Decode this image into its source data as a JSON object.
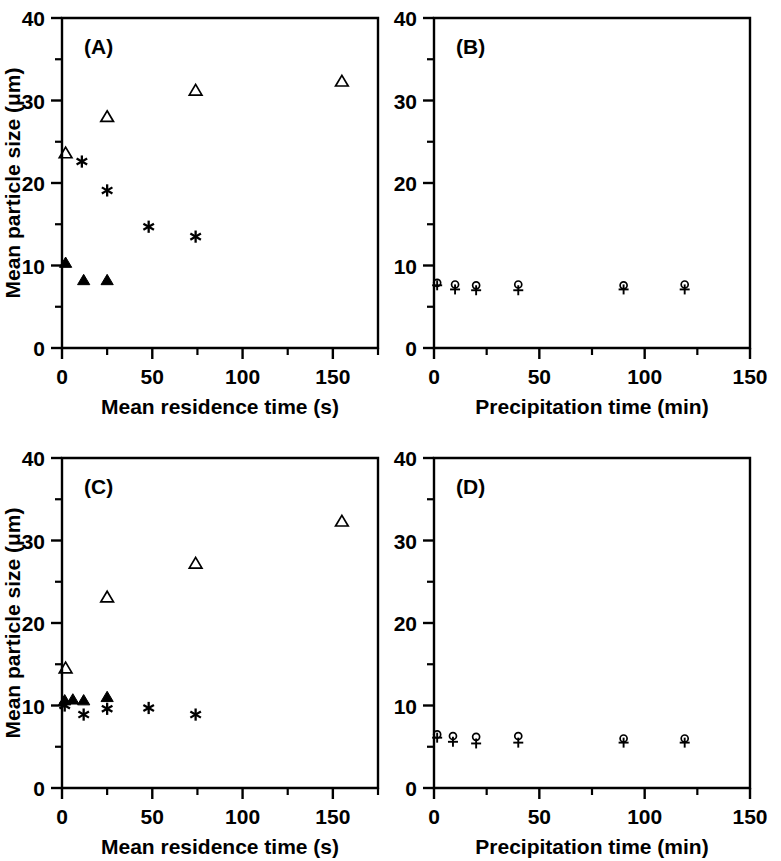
{
  "figure": {
    "panels_order": [
      "A",
      "B",
      "C",
      "D"
    ]
  },
  "panelA": {
    "label": "(A)",
    "xlabel": "Mean residence time (s)",
    "ylabel": "Mean particle size (μm)",
    "xticks": [
      "0",
      "50",
      "100",
      "150"
    ],
    "yticks": [
      "0",
      "10",
      "20",
      "30",
      "40"
    ]
  },
  "panelB": {
    "label": "(B)",
    "xlabel": "Precipitation time (min)",
    "ylabel": "",
    "xticks": [
      "0",
      "50",
      "100",
      "150"
    ],
    "yticks": [
      "0",
      "10",
      "20",
      "30",
      "40"
    ]
  },
  "panelC": {
    "label": "(C)",
    "xlabel": "Mean residence time (s)",
    "ylabel": "Mean particle size (μm)",
    "xticks": [
      "0",
      "50",
      "100",
      "150"
    ],
    "yticks": [
      "0",
      "10",
      "20",
      "30",
      "40"
    ]
  },
  "panelD": {
    "label": "(D)",
    "xlabel": "Precipitation time (min)",
    "ylabel": "",
    "xticks": [
      "0",
      "50",
      "100",
      "150"
    ],
    "yticks": [
      "0",
      "10",
      "20",
      "30",
      "40"
    ]
  },
  "chart_data": [
    {
      "id": "A",
      "type": "scatter",
      "title": "(A)",
      "xlabel": "Mean residence time (s)",
      "ylabel": "Mean particle size (μm)",
      "xlim": [
        0,
        175
      ],
      "ylim": [
        0,
        40
      ],
      "xticks": [
        0,
        50,
        100,
        150
      ],
      "yticks": [
        0,
        10,
        20,
        30,
        40
      ],
      "xminor": [
        25,
        75,
        125,
        175
      ],
      "yminor": [
        5,
        15,
        25,
        35
      ],
      "grid": false,
      "legend": "none",
      "series": [
        {
          "name": "open-triangle",
          "marker": "open-triangle",
          "points": [
            {
              "x": 2,
              "y": 23.6
            },
            {
              "x": 25,
              "y": 28.0
            },
            {
              "x": 74,
              "y": 31.2
            },
            {
              "x": 155,
              "y": 32.3
            }
          ]
        },
        {
          "name": "asterisk",
          "marker": "asterisk",
          "points": [
            {
              "x": 11,
              "y": 22.6
            },
            {
              "x": 25,
              "y": 19.1
            },
            {
              "x": 48,
              "y": 14.7
            },
            {
              "x": 74,
              "y": 13.5
            }
          ]
        },
        {
          "name": "filled-triangle",
          "marker": "filled-triangle",
          "points": [
            {
              "x": 2,
              "y": 10.3
            },
            {
              "x": 12,
              "y": 8.2
            },
            {
              "x": 25,
              "y": 8.2
            }
          ]
        }
      ]
    },
    {
      "id": "B",
      "type": "scatter",
      "title": "(B)",
      "xlabel": "Precipitation time (min)",
      "ylabel": "Mean particle size (μm)",
      "xlim": [
        0,
        150
      ],
      "ylim": [
        0,
        40
      ],
      "xticks": [
        0,
        50,
        100,
        150
      ],
      "yticks": [
        0,
        10,
        20,
        30,
        40
      ],
      "xminor": [
        25,
        75,
        125
      ],
      "yminor": [
        5,
        15,
        25,
        35
      ],
      "grid": false,
      "legend": "none",
      "series": [
        {
          "name": "open-circle",
          "marker": "open-circle",
          "points": [
            {
              "x": 1.5,
              "y": 7.9
            },
            {
              "x": 10,
              "y": 7.7
            },
            {
              "x": 20,
              "y": 7.6
            },
            {
              "x": 40,
              "y": 7.7
            },
            {
              "x": 90,
              "y": 7.6
            },
            {
              "x": 119,
              "y": 7.7
            }
          ]
        },
        {
          "name": "plus",
          "marker": "plus",
          "points": [
            {
              "x": 1.5,
              "y": 7.6
            },
            {
              "x": 10,
              "y": 7.1
            },
            {
              "x": 20,
              "y": 7.0
            },
            {
              "x": 40,
              "y": 7.0
            },
            {
              "x": 90,
              "y": 7.1
            },
            {
              "x": 119,
              "y": 7.1
            }
          ]
        }
      ]
    },
    {
      "id": "C",
      "type": "scatter",
      "title": "(C)",
      "xlabel": "Mean residence time (s)",
      "ylabel": "Mean particle size (μm)",
      "xlim": [
        0,
        175
      ],
      "ylim": [
        0,
        40
      ],
      "xticks": [
        0,
        50,
        100,
        150
      ],
      "yticks": [
        0,
        10,
        20,
        30,
        40
      ],
      "xminor": [
        25,
        75,
        125,
        175
      ],
      "yminor": [
        5,
        15,
        25,
        35
      ],
      "grid": false,
      "legend": "none",
      "series": [
        {
          "name": "open-triangle",
          "marker": "open-triangle",
          "points": [
            {
              "x": 2,
              "y": 14.5
            },
            {
              "x": 25,
              "y": 23.1
            },
            {
              "x": 74,
              "y": 27.2
            },
            {
              "x": 155,
              "y": 32.3
            }
          ]
        },
        {
          "name": "filled-triangle",
          "marker": "filled-triangle",
          "points": [
            {
              "x": 1.5,
              "y": 10.6
            },
            {
              "x": 6,
              "y": 10.7
            },
            {
              "x": 12,
              "y": 10.6
            },
            {
              "x": 25,
              "y": 11.0
            }
          ]
        },
        {
          "name": "asterisk",
          "marker": "asterisk",
          "points": [
            {
              "x": 1.5,
              "y": 10.0
            },
            {
              "x": 12,
              "y": 8.9
            },
            {
              "x": 25,
              "y": 9.6
            },
            {
              "x": 48,
              "y": 9.7
            },
            {
              "x": 74,
              "y": 8.9
            }
          ]
        }
      ]
    },
    {
      "id": "D",
      "type": "scatter",
      "title": "(D)",
      "xlabel": "Precipitation time (min)",
      "ylabel": "Mean particle size (μm)",
      "xlim": [
        0,
        150
      ],
      "ylim": [
        0,
        40
      ],
      "xticks": [
        0,
        50,
        100,
        150
      ],
      "yticks": [
        0,
        10,
        20,
        30,
        40
      ],
      "xminor": [
        25,
        75,
        125
      ],
      "yminor": [
        5,
        15,
        25,
        35
      ],
      "grid": false,
      "legend": "none",
      "series": [
        {
          "name": "open-circle",
          "marker": "open-circle",
          "points": [
            {
              "x": 1.5,
              "y": 6.5
            },
            {
              "x": 9,
              "y": 6.3
            },
            {
              "x": 20,
              "y": 6.2
            },
            {
              "x": 40,
              "y": 6.3
            },
            {
              "x": 90,
              "y": 6.0
            },
            {
              "x": 119,
              "y": 6.0
            }
          ]
        },
        {
          "name": "plus",
          "marker": "plus",
          "points": [
            {
              "x": 1.5,
              "y": 6.1
            },
            {
              "x": 9,
              "y": 5.6
            },
            {
              "x": 20,
              "y": 5.4
            },
            {
              "x": 40,
              "y": 5.5
            },
            {
              "x": 90,
              "y": 5.5
            },
            {
              "x": 119,
              "y": 5.5
            }
          ]
        }
      ]
    }
  ]
}
